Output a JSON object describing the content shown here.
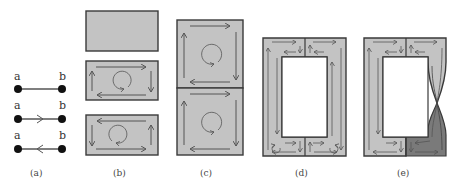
{
  "figure": {
    "panels": [
      {
        "id": "a",
        "label": "(a)",
        "description": "Edge between vertices a and b: undirected, directed a→b, directed b→a",
        "edges": [
          {
            "from_label": "a",
            "to_label": "b",
            "orientation": "none"
          },
          {
            "from_label": "a",
            "to_label": "b",
            "orientation": "forward"
          },
          {
            "from_label": "a",
            "to_label": "b",
            "orientation": "backward"
          }
        ]
      },
      {
        "id": "b",
        "label": "(b)",
        "description": "Rectangle faces: unoriented, clockwise orientation, counter-clockwise orientation"
      },
      {
        "id": "c",
        "label": "(c)",
        "description": "Two stacked oriented square faces glued along shared edge, both clockwise"
      },
      {
        "id": "d",
        "label": "(d)",
        "description": "Annulus built from four oriented faces with induced boundary orientations"
      },
      {
        "id": "e",
        "label": "(e)",
        "description": "Annulus with a pinch (twist) on the right side; lower right part shaded darker"
      }
    ],
    "vertex_labels": {
      "a": "a",
      "b": "b"
    },
    "colors": {
      "face": "#c3c3c3",
      "dark_face": "#7a7a7a",
      "stroke": "#3a3a3a",
      "arrow": "#555555"
    }
  }
}
